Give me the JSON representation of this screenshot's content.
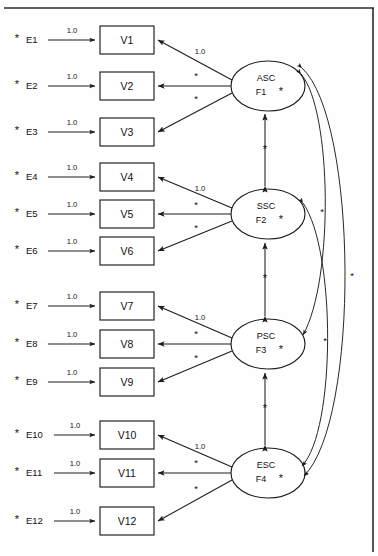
{
  "diagram": {
    "type": "sem-path-diagram",
    "title": "",
    "frame": {
      "top_border": true,
      "right_border": true,
      "color": "#2b2b2b"
    },
    "symbols": {
      "free_parameter": "*",
      "fixed_loading": "1.0"
    },
    "errors": [
      {
        "id": "E1",
        "star": "*",
        "weight": "1.0",
        "target": "V1"
      },
      {
        "id": "E2",
        "star": "*",
        "weight": "1.0",
        "target": "V2"
      },
      {
        "id": "E3",
        "star": "*",
        "weight": "1.0",
        "target": "V3"
      },
      {
        "id": "E4",
        "star": "*",
        "weight": "1.0",
        "target": "V4"
      },
      {
        "id": "E5",
        "star": "*",
        "weight": "1.0",
        "target": "V5"
      },
      {
        "id": "E6",
        "star": "*",
        "weight": "1.0",
        "target": "V6"
      },
      {
        "id": "E7",
        "star": "*",
        "weight": "1.0",
        "target": "V7"
      },
      {
        "id": "E8",
        "star": "*",
        "weight": "1.0",
        "target": "V8"
      },
      {
        "id": "E9",
        "star": "*",
        "weight": "1.0",
        "target": "V9"
      },
      {
        "id": "E10",
        "star": "*",
        "weight": "1.0",
        "target": "V10"
      },
      {
        "id": "E11",
        "star": "*",
        "weight": "1.0",
        "target": "V11"
      },
      {
        "id": "E12",
        "star": "*",
        "weight": "1.0",
        "target": "V12"
      }
    ],
    "indicators": [
      {
        "id": "V1"
      },
      {
        "id": "V2"
      },
      {
        "id": "V3"
      },
      {
        "id": "V4"
      },
      {
        "id": "V5"
      },
      {
        "id": "V6"
      },
      {
        "id": "V7"
      },
      {
        "id": "V8"
      },
      {
        "id": "V9"
      },
      {
        "id": "V10"
      },
      {
        "id": "V11"
      },
      {
        "id": "V12"
      }
    ],
    "factors": [
      {
        "name": "ASC",
        "code": "F1",
        "star": "*",
        "loadings": [
          {
            "indicator": "V1",
            "label": "1.0"
          },
          {
            "indicator": "V2",
            "label": "*"
          },
          {
            "indicator": "V3",
            "label": "*"
          }
        ]
      },
      {
        "name": "SSC",
        "code": "F2",
        "star": "*",
        "loadings": [
          {
            "indicator": "V4",
            "label": "1.0"
          },
          {
            "indicator": "V5",
            "label": "*"
          },
          {
            "indicator": "V6",
            "label": "*"
          }
        ]
      },
      {
        "name": "PSC",
        "code": "F3",
        "star": "*",
        "loadings": [
          {
            "indicator": "V7",
            "label": "1.0"
          },
          {
            "indicator": "V8",
            "label": "*"
          },
          {
            "indicator": "V9",
            "label": "*"
          }
        ]
      },
      {
        "name": "ESC",
        "code": "F4",
        "star": "*",
        "loadings": [
          {
            "indicator": "V10",
            "label": "1.0"
          },
          {
            "indicator": "V11",
            "label": "*"
          },
          {
            "indicator": "V12",
            "label": "*"
          }
        ]
      }
    ],
    "correlations": [
      {
        "from": "F1",
        "to": "F2",
        "label": "*",
        "shape": "vertical"
      },
      {
        "from": "F2",
        "to": "F3",
        "label": "*",
        "shape": "vertical"
      },
      {
        "from": "F3",
        "to": "F4",
        "label": "*",
        "shape": "vertical"
      },
      {
        "from": "F1",
        "to": "F3",
        "label": "*",
        "shape": "curve-right-inner"
      },
      {
        "from": "F1",
        "to": "F4",
        "label": "*",
        "shape": "curve-right-mid"
      },
      {
        "from": "F2",
        "to": "F4",
        "label": "*",
        "shape": "curve-right-outer"
      }
    ]
  }
}
